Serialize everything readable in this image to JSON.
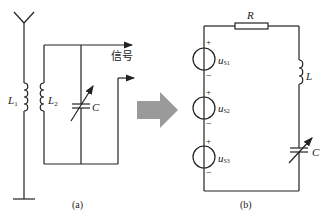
{
  "diagram": {
    "panel_a": {
      "caption": "(a)",
      "inductor_1_label": "L",
      "inductor_1_sub": "1",
      "inductor_2_label": "L",
      "inductor_2_sub": "2",
      "capacitor_label": "C",
      "signal_label": "信号"
    },
    "panel_b": {
      "caption": "(b)",
      "resistor_label": "R",
      "inductor_label": "L",
      "capacitor_label": "C",
      "sources": [
        {
          "label": "u",
          "sub": "S1",
          "plus": "+",
          "minus": "−"
        },
        {
          "label": "u",
          "sub": "S2",
          "plus": "+",
          "minus": "−"
        },
        {
          "label": "u",
          "sub": "S3",
          "plus": "+",
          "minus": "−"
        }
      ]
    },
    "arrow_color": "#9a9a9a",
    "line_color": "#222222"
  }
}
